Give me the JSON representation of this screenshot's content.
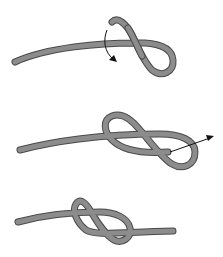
{
  "diagram": {
    "rope_color": "#8c8c8c",
    "rope_outline_color": "#4a4a4a",
    "arrow_color": "#111111",
    "steps": [
      {
        "index": 1,
        "description": "Form a loop and pass the working end under the standing part",
        "arrow": "curved-down"
      },
      {
        "index": 2,
        "description": "Pass the working end through the loop",
        "arrow": "pull-right"
      },
      {
        "index": 3,
        "description": "Tighten the finished figure-eight knot",
        "arrow": "none"
      }
    ]
  },
  "caption": {
    "text": ""
  }
}
